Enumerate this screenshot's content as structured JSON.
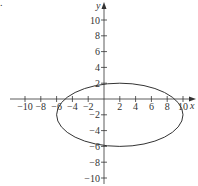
{
  "figure_label": ".",
  "chart_data": {
    "type": "line",
    "title": "",
    "xlabel": "x",
    "ylabel": "y",
    "xlim": [
      -11,
      11
    ],
    "ylim": [
      -11,
      11
    ],
    "grid": false,
    "x_ticks": [
      -10,
      -8,
      -6,
      -4,
      -2,
      2,
      4,
      6,
      8,
      10
    ],
    "y_ticks": [
      -10,
      -8,
      -6,
      -4,
      -2,
      2,
      4,
      6,
      8,
      10
    ],
    "x_tick_labels": [
      "−10",
      "−8",
      "−6",
      "−4",
      "−2",
      "2",
      "4",
      "6",
      "8",
      "10"
    ],
    "y_tick_labels": [
      "−10",
      "−8",
      "−6",
      "−4",
      "−2",
      "2",
      "4",
      "6",
      "8",
      "10"
    ],
    "series": [
      {
        "name": "ellipse",
        "shape": "ellipse",
        "center": [
          2,
          -2
        ],
        "semi_axis_x": 8,
        "semi_axis_y": 4,
        "points": [
          [
            -6,
            -2
          ],
          [
            2,
            2
          ],
          [
            10,
            -2
          ],
          [
            2,
            -6
          ]
        ]
      }
    ],
    "color": "#333333"
  }
}
